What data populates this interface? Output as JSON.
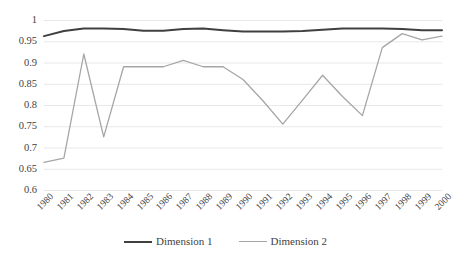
{
  "chart_data": {
    "type": "line",
    "title": "",
    "xlabel": "",
    "ylabel": "",
    "ylim": [
      0.6,
      1
    ],
    "ytick_step": 0.05,
    "grid": true,
    "legend_position": "bottom",
    "categories": [
      "1980",
      "1981",
      "1982",
      "1983",
      "1984",
      "1985",
      "1986",
      "1987",
      "1988",
      "1989",
      "1990",
      "1991",
      "1992",
      "1993",
      "1994",
      "1995",
      "1996",
      "1997",
      "1998",
      "1999",
      "2000"
    ],
    "ytick_labels": [
      "1",
      "0.95",
      "0.9",
      "0.85",
      "0.8",
      "0.75",
      "0.7",
      "0.65",
      "0.6"
    ],
    "ytick_values": [
      1,
      0.95,
      0.9,
      0.85,
      0.8,
      0.75,
      0.7,
      0.65,
      0.6
    ],
    "series": [
      {
        "name": "Dimension 1",
        "color": "#404040",
        "width": 2.0,
        "values": [
          0.962,
          0.974,
          0.98,
          0.98,
          0.979,
          0.975,
          0.975,
          0.979,
          0.98,
          0.976,
          0.973,
          0.973,
          0.973,
          0.974,
          0.977,
          0.98,
          0.98,
          0.98,
          0.979,
          0.976,
          0.976
        ]
      },
      {
        "name": "Dimension 2",
        "color": "#a6a6a6",
        "width": 1.3,
        "values": [
          0.665,
          0.675,
          0.92,
          0.725,
          0.89,
          0.89,
          0.89,
          0.905,
          0.89,
          0.89,
          0.86,
          0.81,
          0.755,
          0.812,
          0.87,
          0.82,
          0.775,
          0.935,
          0.968,
          0.953,
          0.962
        ]
      }
    ]
  },
  "legend": {
    "items": [
      {
        "label": "Dimension 1",
        "color": "#404040",
        "width": "2px"
      },
      {
        "label": "Dimension 2",
        "color": "#a6a6a6",
        "width": "1.4px"
      }
    ]
  },
  "colors": {
    "background": "#ffffff",
    "grid": "#e8e8e8",
    "axis_text": "#3f3f3f",
    "dimension_1": "#404040",
    "dimension_2": "#a6a6a6"
  }
}
